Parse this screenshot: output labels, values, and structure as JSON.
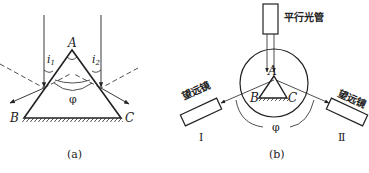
{
  "figure_a": {
    "apex_label": "A",
    "left_vertex_label": "B",
    "right_vertex_label": "C",
    "incidence_angle_1": {
      "symbol": "i",
      "subscript": "1"
    },
    "incidence_angle_2": {
      "symbol": "i",
      "subscript": "2"
    },
    "angle_label": "φ",
    "caption": "(a)"
  },
  "figure_b": {
    "collimator_label": "平行光管",
    "apex_label": "A",
    "left_vertex_label": "B",
    "right_vertex_label": "C",
    "telescope_label_left": "望远镜",
    "telescope_label_right": "望远镜",
    "telescope_numeral_left": "Ⅰ",
    "telescope_numeral_right": "Ⅱ",
    "angle_label": "φ",
    "caption": "(b)"
  },
  "colors": {
    "stroke": "#222222",
    "background": "#ffffff"
  }
}
